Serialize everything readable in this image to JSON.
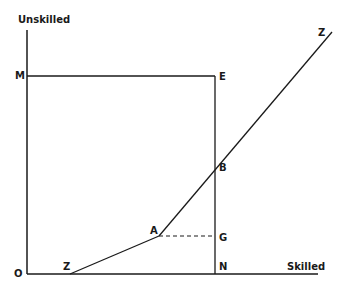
{
  "diagram": {
    "axes": {
      "y_label": "Unskilled",
      "x_label": "Skilled",
      "origin_label": "O"
    },
    "points": {
      "M": "M",
      "E": "E",
      "B": "B",
      "A": "A",
      "G": "G",
      "N": "N",
      "Z_bottom": "Z",
      "Z_top": "Z"
    },
    "lines": [
      {
        "name": "y-axis",
        "from": "O",
        "to": "top",
        "style": "solid"
      },
      {
        "name": "x-axis",
        "from": "O",
        "to": "right",
        "style": "solid"
      },
      {
        "name": "M-E",
        "from": "M",
        "to": "E",
        "style": "solid"
      },
      {
        "name": "E-N",
        "from": "E",
        "to": "N",
        "style": "solid"
      },
      {
        "name": "Z-A",
        "from": "Z",
        "to": "A",
        "style": "solid"
      },
      {
        "name": "A-Z",
        "from": "A",
        "to": "Z",
        "style": "solid",
        "passes_through": "B"
      },
      {
        "name": "A-G",
        "from": "A",
        "to": "G",
        "style": "dashed"
      }
    ],
    "colors": {
      "ink": "#1a1a1a",
      "background": "#ffffff"
    }
  }
}
